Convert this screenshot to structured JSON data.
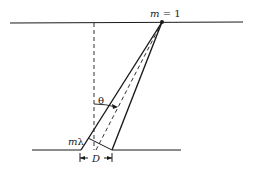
{
  "diagram": {
    "labels": {
      "order": "m = 1",
      "order_var": "m",
      "order_eq": " = 1",
      "angle": "θ",
      "path_difference": "mλ",
      "path_m": "m",
      "path_lambda": "λ",
      "spacing": "D"
    },
    "colors": {
      "line": "#1a1a1a",
      "background": "#ffffff"
    }
  }
}
